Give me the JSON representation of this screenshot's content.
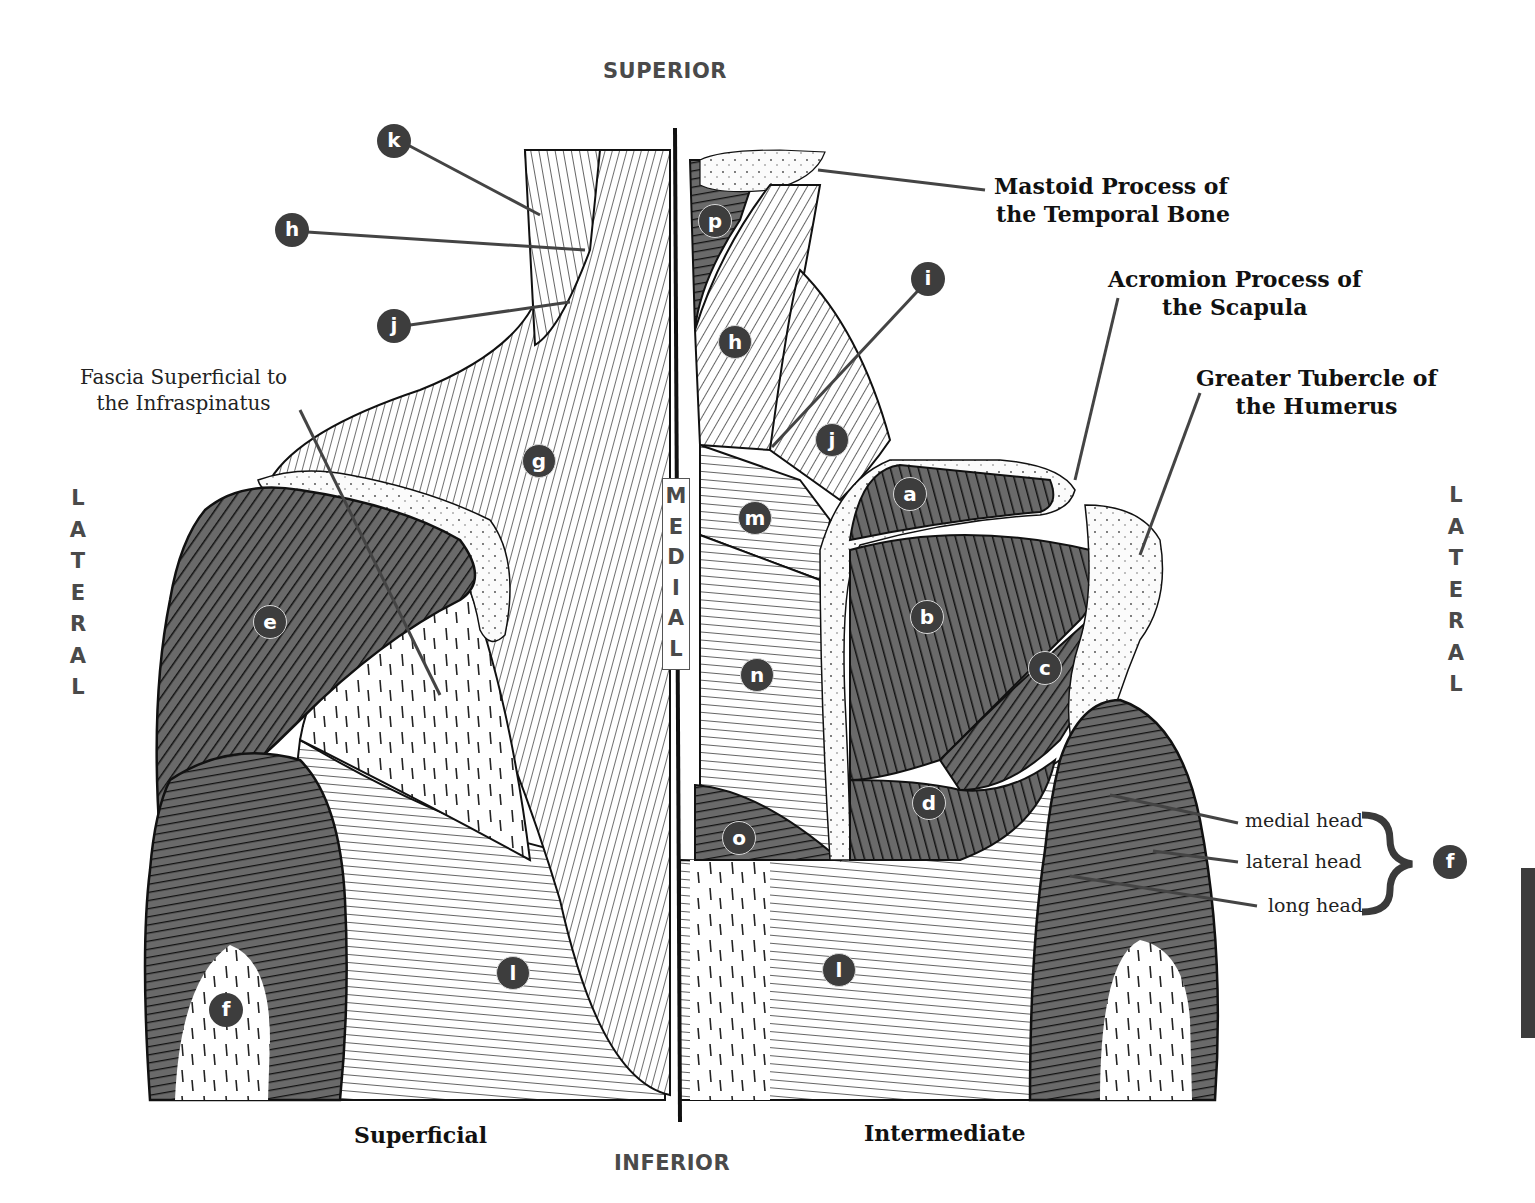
{
  "orientation": {
    "superior": "SUPERIOR",
    "inferior": "INFERIOR",
    "lateral_left": [
      "L",
      "A",
      "T",
      "E",
      "R",
      "A",
      "L"
    ],
    "lateral_right": [
      "L",
      "A",
      "T",
      "E",
      "R",
      "A",
      "L"
    ],
    "medial": [
      "M",
      "E",
      "D",
      "I",
      "A",
      "L"
    ]
  },
  "views": {
    "left": "Superficial",
    "right": "Intermediate"
  },
  "callouts": {
    "mastoid": [
      "Mastoid Process of",
      "the Temporal Bone"
    ],
    "acromion": [
      "Acromion Process of",
      "the Scapula"
    ],
    "greater_tubercle": [
      "Greater Tubercle of",
      "the Humerus"
    ],
    "fascia": [
      "Fascia Superficial to",
      "the Infraspinatus"
    ]
  },
  "triceps_heads": {
    "medial": "medial head",
    "lateral": "lateral head",
    "long": "long head",
    "group_marker": "f"
  },
  "markers": [
    {
      "id": "k-left",
      "letter": "k",
      "x": 377,
      "y": 124,
      "ringed": false
    },
    {
      "id": "h-left",
      "letter": "h",
      "x": 275,
      "y": 213,
      "ringed": false
    },
    {
      "id": "j-left",
      "letter": "j",
      "x": 377,
      "y": 309,
      "ringed": false
    },
    {
      "id": "g-left",
      "letter": "g",
      "x": 522,
      "y": 444,
      "ringed": true
    },
    {
      "id": "e-left",
      "letter": "e",
      "x": 253,
      "y": 605,
      "ringed": true
    },
    {
      "id": "f-left",
      "letter": "f",
      "x": 209,
      "y": 993,
      "ringed": false
    },
    {
      "id": "l-left",
      "letter": "l",
      "x": 496,
      "y": 956,
      "ringed": true
    },
    {
      "id": "p-right",
      "letter": "p",
      "x": 698,
      "y": 204,
      "ringed": true
    },
    {
      "id": "h-right",
      "letter": "h",
      "x": 718,
      "y": 325,
      "ringed": true
    },
    {
      "id": "i-right",
      "letter": "i",
      "x": 911,
      "y": 262,
      "ringed": false
    },
    {
      "id": "j-right",
      "letter": "j",
      "x": 815,
      "y": 423,
      "ringed": true
    },
    {
      "id": "a-right",
      "letter": "a",
      "x": 893,
      "y": 477,
      "ringed": true
    },
    {
      "id": "m-right",
      "letter": "m",
      "x": 738,
      "y": 501,
      "ringed": true
    },
    {
      "id": "b-right",
      "letter": "b",
      "x": 910,
      "y": 600,
      "ringed": true
    },
    {
      "id": "n-right",
      "letter": "n",
      "x": 740,
      "y": 658,
      "ringed": true
    },
    {
      "id": "c-right",
      "letter": "c",
      "x": 1028,
      "y": 651,
      "ringed": true
    },
    {
      "id": "d-right",
      "letter": "d",
      "x": 912,
      "y": 786,
      "ringed": true
    },
    {
      "id": "o-right",
      "letter": "o",
      "x": 722,
      "y": 821,
      "ringed": true
    },
    {
      "id": "l-right",
      "letter": "l",
      "x": 822,
      "y": 953,
      "ringed": true
    },
    {
      "id": "f-right",
      "letter": "f",
      "x": 1433,
      "y": 845,
      "ringed": false
    }
  ],
  "colors": {
    "muscle_dark": "#5a5a5a",
    "muscle_light": "#ffffff",
    "bone": "#f4f4f4",
    "line": "#111111",
    "marker_fill": "#3d3d3d",
    "label_gray": "#4a4a4a"
  }
}
